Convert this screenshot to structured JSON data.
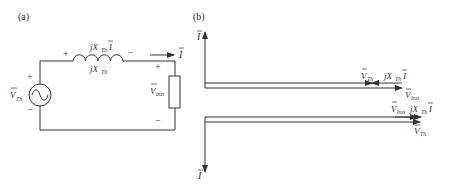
{
  "panel_a": {
    "label": "(a)",
    "source_label": "V",
    "source_sub": "Th",
    "source_plus": "+",
    "source_minus": "−",
    "inductor_voltage_prefix": "jX",
    "inductor_voltage_sub": "Th",
    "inductor_voltage_suffix": "I",
    "inductor_label_prefix": "jX",
    "inductor_label_sub": "Th",
    "inductor_plus": "+",
    "inductor_minus": "−",
    "current_label": "I",
    "load_label": "V",
    "load_sub": "bus",
    "load_plus": "+",
    "load_minus": "−"
  },
  "panel_b": {
    "label": "(b)",
    "upper": {
      "axis_label": "I",
      "vth_label": "V",
      "vth_sub": "Th",
      "jx_prefix": "jX",
      "jx_sub": "Th",
      "jx_suffix": "I",
      "vbus_label": "V",
      "vbus_sub": "bus"
    },
    "lower": {
      "axis_label": "I",
      "vbus_label": "V",
      "vbus_sub": "bus",
      "jx_prefix": "jX",
      "jx_sub": "Th",
      "jx_suffix": "I",
      "vth_label": "V",
      "vth_sub": "Th"
    }
  },
  "colors": {
    "line": "#333333",
    "background": "#ffffff"
  }
}
